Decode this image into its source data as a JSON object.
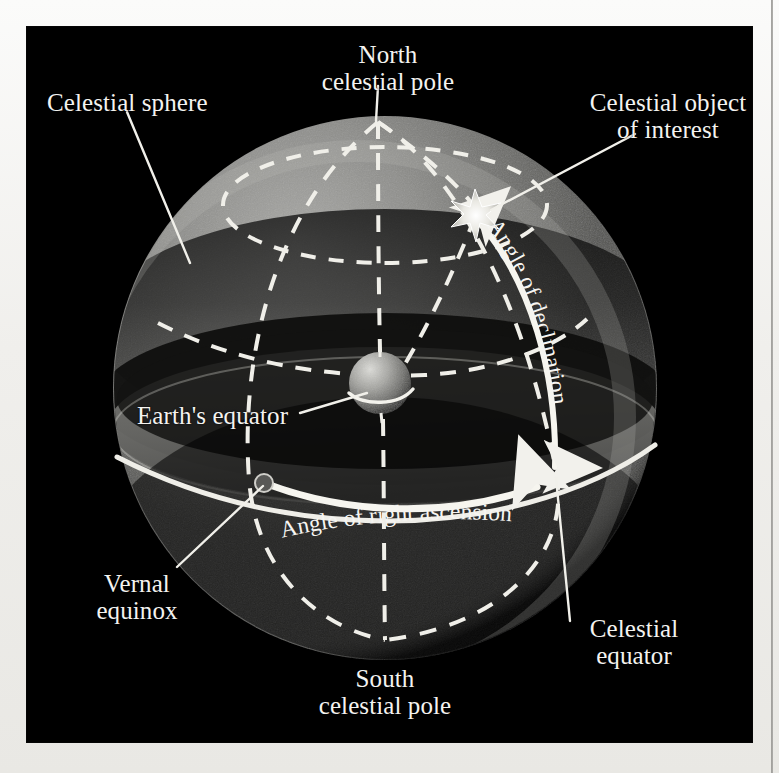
{
  "figure": {
    "background_color": "#000000",
    "paper_color": "#f2f1ee",
    "line_color": "#f4f3f0"
  },
  "labels": {
    "north_celestial_pole_line1": "North",
    "north_celestial_pole_line2": "celestial pole",
    "celestial_sphere": "Celestial sphere",
    "celestial_object_line1": "Celestial object",
    "celestial_object_line2": "of interest",
    "earths_equator": "Earth's equator",
    "angle_of_right_ascension": "Angle of right ascension",
    "angle_of_declination": "Angle of declination",
    "vernal_equinox_line1": "Vernal",
    "vernal_equinox_line2": "equinox",
    "celestial_equator_line1": "Celestial",
    "celestial_equator_line2": "equator",
    "south_celestial_pole_line1": "South",
    "south_celestial_pole_line2": "celestial pole"
  },
  "elements": {
    "celestial_sphere": {
      "name": "celestial-sphere",
      "center_x": 358,
      "center_y": 361,
      "radius": 272,
      "shading": "grey shaded sphere, bright upper-left limb, dark band across middle"
    },
    "earth": {
      "name": "earth-globe",
      "center_x": 353,
      "center_y": 356,
      "radius": 31,
      "has_equator_line": true
    },
    "celestial_object": {
      "name": "star-marker",
      "x": 448,
      "y": 180,
      "glyph": "star"
    },
    "north_celestial_pole_point": {
      "x": 351,
      "y": 95
    },
    "south_celestial_pole_point": {
      "x": 358,
      "y": 613
    },
    "vernal_equinox_point": {
      "x": 237,
      "y": 456
    },
    "right_ascension_arc": {
      "from_x": 237,
      "from_y": 456,
      "to_x": 528,
      "to_y": 446,
      "style": "solid bright arc with arrowhead at end"
    },
    "declination_arc": {
      "from_x": 528,
      "from_y": 446,
      "to_x": 448,
      "to_y": 180,
      "style": "solid bright arc with double arrowheads"
    },
    "dashed_elements": [
      "circumpolar-circle",
      "meridian-left",
      "meridian-center",
      "meridian-right",
      "meridian-through-object",
      "celestial-equator-ellipse"
    ]
  },
  "callouts": [
    {
      "name": "callout-north-celestial-pole",
      "label_x": 361,
      "label_y": 20,
      "target_x": 351,
      "target_y": 95
    },
    {
      "name": "callout-celestial-sphere",
      "label_x": 22,
      "label_y": 70,
      "target_x": 148,
      "target_y": 245
    },
    {
      "name": "callout-celestial-object",
      "label_x": 615,
      "label_y": 78,
      "target_x": 462,
      "target_y": 186
    },
    {
      "name": "callout-earths-equator",
      "label_x": 120,
      "label_y": 400,
      "target_x": 338,
      "target_y": 368
    },
    {
      "name": "callout-vernal-equinox",
      "label_x": 75,
      "label_y": 565,
      "target_x": 237,
      "target_y": 456
    },
    {
      "name": "callout-celestial-equator",
      "label_x": 530,
      "label_y": 600,
      "target_x": 530,
      "target_y": 452
    },
    {
      "name": "callout-south-celestial-pole",
      "label_x": 358,
      "label_y": 645,
      "target_x": 358,
      "target_y": 613
    }
  ]
}
